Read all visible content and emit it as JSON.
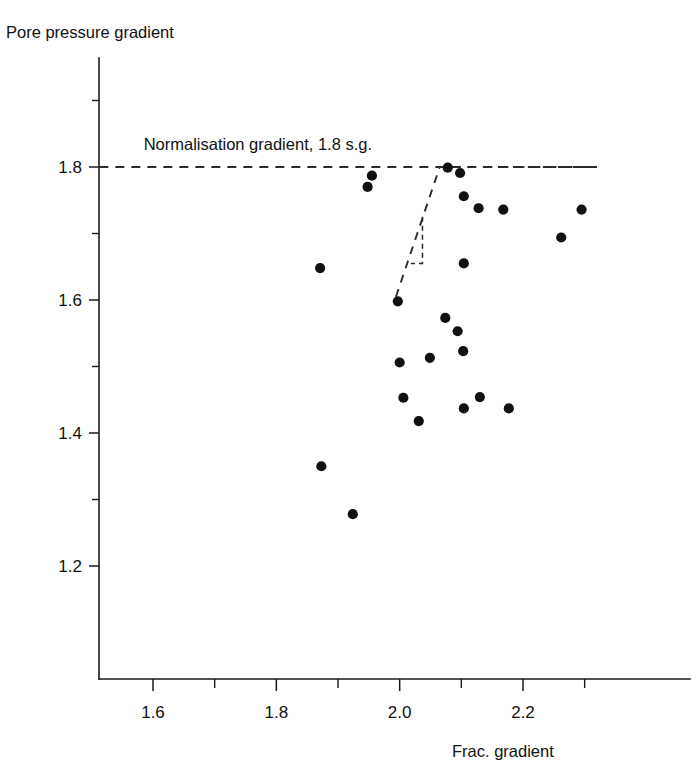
{
  "chart_data": {
    "type": "scatter",
    "title": "",
    "ylabel": "Pore pressure gradient",
    "xlabel": "Frac. gradient",
    "xlim": [
      1.51,
      2.32
    ],
    "ylim": [
      1.1,
      1.89
    ],
    "grid": false,
    "legend": "none",
    "x_ticks_major": [
      "1.6",
      "1.8",
      "2.0",
      "2.2"
    ],
    "x_ticks_major_values": [
      1.6,
      1.8,
      2.0,
      2.2
    ],
    "x_ticks_minor_values": [
      1.7,
      1.9,
      2.1,
      2.3
    ],
    "y_ticks_major": [
      "1.8",
      "1.6",
      "1.4",
      "1.2"
    ],
    "y_ticks_major_values": [
      1.8,
      1.6,
      1.4,
      1.2
    ],
    "y_ticks_minor_values": [
      1.9,
      1.7,
      1.5,
      1.3
    ],
    "annotations": [
      {
        "name": "normalisation-gradient-label",
        "text": "Normalisation gradient, 1.8 s.g.",
        "x": 1.77,
        "y": 1.825
      }
    ],
    "reference_lines": [
      {
        "name": "normalisation-gradient-line",
        "orientation": "horizontal",
        "value": 1.8,
        "style": "dashed",
        "x_from": 1.513,
        "x_to": 2.32
      }
    ],
    "dashed_polylines": [
      {
        "name": "cutoff-envelope",
        "style": "dashed",
        "points": [
          [
            1.994,
            1.605
          ],
          [
            2.065,
            1.8
          ],
          [
            2.32,
            1.8
          ]
        ]
      },
      {
        "name": "cutoff-inner-tick",
        "style": "dashed",
        "points": [
          [
            2.037,
            1.725
          ],
          [
            2.037,
            1.655
          ],
          [
            2.018,
            1.655
          ]
        ]
      }
    ],
    "points": [
      {
        "x": 1.871,
        "y": 1.648
      },
      {
        "x": 1.873,
        "y": 1.35
      },
      {
        "x": 1.924,
        "y": 1.278
      },
      {
        "x": 1.948,
        "y": 1.77
      },
      {
        "x": 1.955,
        "y": 1.787
      },
      {
        "x": 1.997,
        "y": 1.598
      },
      {
        "x": 2.0,
        "y": 1.506
      },
      {
        "x": 2.006,
        "y": 1.453
      },
      {
        "x": 2.031,
        "y": 1.418
      },
      {
        "x": 2.049,
        "y": 1.513
      },
      {
        "x": 2.074,
        "y": 1.573
      },
      {
        "x": 2.098,
        "y": 1.791
      },
      {
        "x": 2.104,
        "y": 1.756
      },
      {
        "x": 2.104,
        "y": 1.655
      },
      {
        "x": 2.103,
        "y": 1.523
      },
      {
        "x": 2.104,
        "y": 1.437
      },
      {
        "x": 2.094,
        "y": 1.553
      },
      {
        "x": 2.078,
        "y": 1.799
      },
      {
        "x": 2.128,
        "y": 1.738
      },
      {
        "x": 2.13,
        "y": 1.454
      },
      {
        "x": 2.168,
        "y": 1.736
      },
      {
        "x": 2.177,
        "y": 1.437
      },
      {
        "x": 2.262,
        "y": 1.694
      },
      {
        "x": 2.295,
        "y": 1.736
      }
    ]
  },
  "axes": {
    "y_axis_title": "Pore pressure gradient",
    "x_axis_title": "Frac. gradient"
  },
  "colors": {
    "point": "#111111",
    "axis": "#1a1a1a",
    "dash": "#2a2a2a",
    "background": "#ffffff"
  }
}
